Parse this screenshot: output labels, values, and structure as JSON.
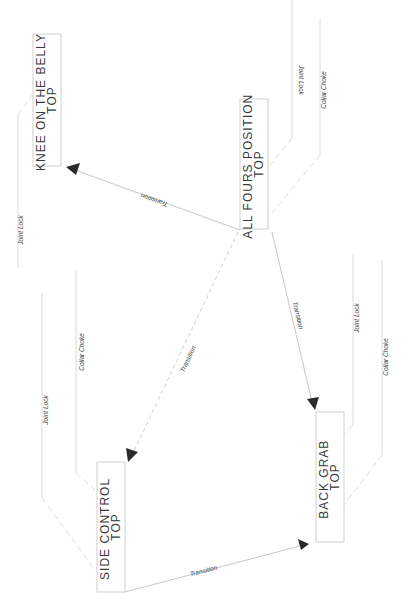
{
  "diagram": {
    "nodes": [
      {
        "id": "kotb",
        "title": "KNEE ON THE BELLY",
        "subtitle": "TOP"
      },
      {
        "id": "afp",
        "title": "ALL FOURS POSITION",
        "subtitle": "TOP"
      },
      {
        "id": "sc",
        "title": "SIDE CONTROL",
        "subtitle": "TOP"
      },
      {
        "id": "bg",
        "title": "BACK GRAB",
        "subtitle": "TOP"
      }
    ],
    "edges": [
      {
        "from": "afp",
        "to": "kotb",
        "label": "Transition"
      },
      {
        "from": "afp",
        "to": "sc",
        "label": "Transition"
      },
      {
        "from": "afp",
        "to": "bg",
        "label": "Transition"
      },
      {
        "from": "sc",
        "to": "bg",
        "label": "Transition"
      }
    ],
    "submissions": {
      "kotb": [
        "Joint Lock"
      ],
      "afp": [
        "Joint Lock",
        "Collar Choke"
      ],
      "sc": [
        "Joint Lock",
        "Collar Choke"
      ],
      "bg": [
        "Joint Lock",
        "Collar Choke"
      ]
    },
    "colors": {
      "line": "#c8c8c8",
      "arrow": "#2b2b2b",
      "text": "#3a3a3a"
    }
  }
}
